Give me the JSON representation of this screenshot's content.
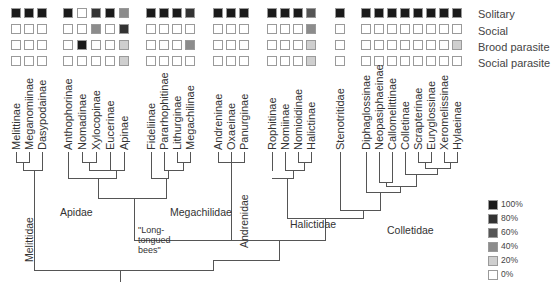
{
  "traits": [
    "Solitary",
    "Social",
    "Brood parasite",
    "Social parasite"
  ],
  "taxa": [
    {
      "name": "Melittinae",
      "x": 16,
      "values": [
        100,
        0,
        0,
        0
      ]
    },
    {
      "name": "Meganomiinae",
      "x": 29,
      "values": [
        100,
        0,
        0,
        0
      ]
    },
    {
      "name": "Dasypodainae",
      "x": 42,
      "values": [
        100,
        0,
        0,
        0
      ]
    },
    {
      "name": "Anthophorinae",
      "x": 68,
      "values": [
        100,
        0,
        0,
        0
      ]
    },
    {
      "name": "Nomadinae",
      "x": 82,
      "values": [
        0,
        0,
        100,
        0
      ]
    },
    {
      "name": "Xylocopinae",
      "x": 96,
      "values": [
        80,
        40,
        0,
        0
      ]
    },
    {
      "name": "Eucerinae",
      "x": 110,
      "values": [
        100,
        0,
        0,
        0
      ]
    },
    {
      "name": "Apinae",
      "x": 124,
      "values": [
        40,
        80,
        20,
        20
      ]
    },
    {
      "name": "Fideliinae",
      "x": 151,
      "values": [
        100,
        0,
        0,
        0
      ]
    },
    {
      "name": "Pararhophitinae",
      "x": 164,
      "values": [
        100,
        0,
        0,
        0
      ]
    },
    {
      "name": "Lithurginae",
      "x": 177,
      "values": [
        100,
        0,
        0,
        0
      ]
    },
    {
      "name": "Megachilinae",
      "x": 190,
      "values": [
        80,
        0,
        40,
        0
      ]
    },
    {
      "name": "Andreninae",
      "x": 218,
      "values": [
        100,
        0,
        0,
        0
      ]
    },
    {
      "name": "Oxaeinae",
      "x": 231,
      "values": [
        100,
        0,
        0,
        0
      ]
    },
    {
      "name": "Panurginae",
      "x": 244,
      "values": [
        100,
        0,
        0,
        0
      ]
    },
    {
      "name": "Rophitinae",
      "x": 272,
      "values": [
        100,
        0,
        0,
        0
      ]
    },
    {
      "name": "Nomiinae",
      "x": 285,
      "values": [
        100,
        0,
        0,
        0
      ]
    },
    {
      "name": "Nomioidinae",
      "x": 298,
      "values": [
        100,
        0,
        0,
        0
      ]
    },
    {
      "name": "Halictinae",
      "x": 311,
      "values": [
        60,
        40,
        20,
        20
      ]
    },
    {
      "name": "Stenotritidae",
      "x": 340,
      "values": [
        100,
        0,
        0,
        0
      ]
    },
    {
      "name": "Diphaglossinae",
      "x": 366,
      "values": [
        100,
        0,
        0,
        0
      ]
    },
    {
      "name": "Neopasiphaeinae",
      "x": 379,
      "values": [
        100,
        0,
        0,
        0
      ]
    },
    {
      "name": "Callomelittinae",
      "x": 392,
      "values": [
        100,
        0,
        0,
        0
      ]
    },
    {
      "name": "Colletinae",
      "x": 405,
      "values": [
        100,
        0,
        0,
        0
      ]
    },
    {
      "name": "Scrapterinae",
      "x": 418,
      "values": [
        100,
        0,
        0,
        0
      ]
    },
    {
      "name": "Euryglossinae",
      "x": 431,
      "values": [
        100,
        0,
        0,
        0
      ]
    },
    {
      "name": "Xeromelissinae",
      "x": 444,
      "values": [
        100,
        0,
        0,
        0
      ]
    },
    {
      "name": "Hylaeinae",
      "x": 457,
      "values": [
        100,
        0,
        20,
        0
      ]
    }
  ],
  "clades": {
    "melittidae": "Melittidae",
    "apidae": "Apidae",
    "megachilidae": "Megachilidae",
    "long_tongued": [
      "\"Long-",
      "tongued",
      "bees\""
    ],
    "andrenidae": "Andrenidae",
    "halictidae": "Halictidae",
    "colletidae": "Colletidae"
  },
  "legend": [
    {
      "label": "100%",
      "color": "#1a1a1a"
    },
    {
      "label": "80%",
      "color": "#333333"
    },
    {
      "label": "60%",
      "color": "#555555"
    },
    {
      "label": "40%",
      "color": "#8c8c8c"
    },
    {
      "label": "20%",
      "color": "#cfcfcf"
    },
    {
      "label": "0%",
      "color": "#ffffff"
    }
  ],
  "chart_data": {
    "type": "heatmap",
    "title": "",
    "rows": [
      "Solitary",
      "Social",
      "Brood parasite",
      "Social parasite"
    ],
    "columns": [
      "Melittinae",
      "Meganomiinae",
      "Dasypodainae",
      "Anthophorinae",
      "Nomadinae",
      "Xylocopinae",
      "Eucerinae",
      "Apinae",
      "Fideliinae",
      "Pararhophitinae",
      "Lithurginae",
      "Megachilinae",
      "Andreninae",
      "Oxaeinae",
      "Panurginae",
      "Rophitinae",
      "Nomiinae",
      "Nomioidinae",
      "Halictinae",
      "Stenotritidae",
      "Diphaglossinae",
      "Neopasiphaeinae",
      "Callomelittinae",
      "Colletinae",
      "Scrapterinae",
      "Euryglossinae",
      "Xeromelissinae",
      "Hylaeinae"
    ],
    "values": [
      [
        100,
        100,
        100,
        100,
        0,
        80,
        100,
        40,
        100,
        100,
        100,
        80,
        100,
        100,
        100,
        100,
        100,
        100,
        60,
        100,
        100,
        100,
        100,
        100,
        100,
        100,
        100,
        100
      ],
      [
        0,
        0,
        0,
        0,
        0,
        40,
        0,
        80,
        0,
        0,
        0,
        0,
        0,
        0,
        0,
        0,
        0,
        0,
        40,
        0,
        0,
        0,
        0,
        0,
        0,
        0,
        0,
        0
      ],
      [
        0,
        0,
        0,
        0,
        100,
        0,
        0,
        20,
        0,
        0,
        0,
        40,
        0,
        0,
        0,
        0,
        0,
        0,
        20,
        0,
        0,
        0,
        0,
        0,
        0,
        0,
        0,
        20
      ],
      [
        0,
        0,
        0,
        0,
        0,
        0,
        0,
        20,
        0,
        0,
        0,
        0,
        0,
        0,
        0,
        0,
        0,
        0,
        20,
        0,
        0,
        0,
        0,
        0,
        0,
        0,
        0,
        0
      ]
    ],
    "legend": [
      "100%",
      "80%",
      "60%",
      "40%",
      "20%",
      "0%"
    ],
    "legend_position": "bottom-right",
    "clades": [
      "Melittidae",
      "Apidae",
      "Megachilidae",
      "Long-tongued bees",
      "Andrenidae",
      "Halictidae",
      "Colletidae"
    ]
  }
}
